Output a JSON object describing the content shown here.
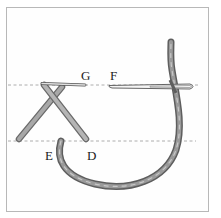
{
  "diagram": {
    "type": "embroidery-stitch-illustration",
    "labels": {
      "g": "G",
      "f": "F",
      "e": "E",
      "d": "D"
    },
    "colors": {
      "thread": "#8a8a8a",
      "thread_dark": "#5e5e5e",
      "thread_light": "#b9b9b9",
      "guide_line": "#9a9a9a",
      "frame": "#b8b8b8",
      "needle": "#f4f4f4"
    },
    "guide_lines": [
      {
        "name": "upper-guide",
        "y": 85
      },
      {
        "name": "lower-guide",
        "y": 141
      }
    ]
  }
}
